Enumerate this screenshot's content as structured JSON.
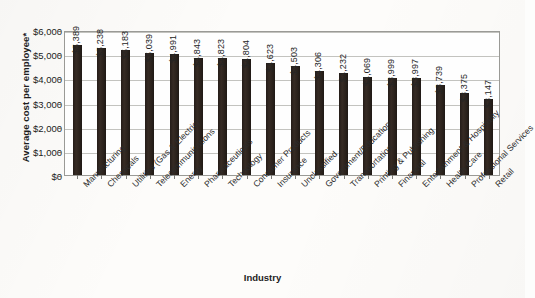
{
  "chart_data": {
    "type": "bar",
    "title": "",
    "xlabel": "Industry",
    "ylabel": "Average cost per employee*",
    "ylim": [
      0,
      6000
    ],
    "ytick_labels": [
      "$6,000",
      "$5,000",
      "$4,000",
      "$3,000",
      "$2,000",
      "$1,000",
      "$0"
    ],
    "ytick_values": [
      6000,
      5000,
      4000,
      3000,
      2000,
      1000,
      0
    ],
    "grid": true,
    "legend": "none",
    "bar_color": "#2b221c",
    "categories": [
      "Manufacturing",
      "Chemicals",
      "Utilities (Gas & Electric)",
      "Telecommunications",
      "Energy",
      "Pharmaceuticals",
      "Technology",
      "Consumer Products",
      "Insurance",
      "Unclassified",
      "Government/Education",
      "Transportation",
      "Printing & Publishing",
      "Financial",
      "Entertainment & Hospitality",
      "Health Care",
      "Professional Services",
      "Retail"
    ],
    "values": [
      5389,
      5238,
      5183,
      5039,
      4991,
      4843,
      4823,
      4804,
      4623,
      4503,
      4306,
      4232,
      4069,
      3999,
      3997,
      3739,
      3375,
      3147
    ],
    "value_labels": [
      "$5,389",
      "$5,238",
      "$5,183",
      "$5,039",
      "$4,991",
      "$4,843",
      "$4,823",
      "$4,804",
      "$4,623",
      "$4,503",
      "$4,306",
      "$4,232",
      "$4,069",
      "$3,999",
      "$3,997",
      "$3,739",
      "$3,375",
      "$3,147"
    ]
  }
}
